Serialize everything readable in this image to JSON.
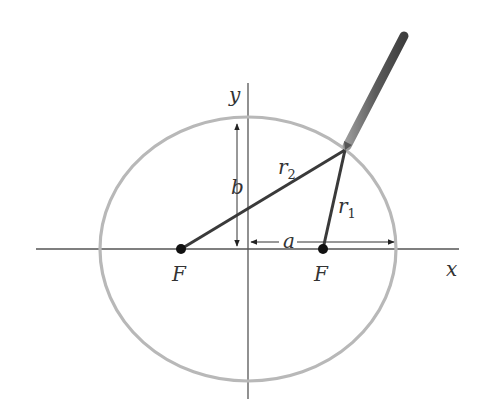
{
  "diagram": {
    "colors": {
      "ellipse": "#b8b8b8",
      "axis": "#555555",
      "string": "#3a3a3a",
      "focus": "#111111",
      "pen_light": "#8a8a8a",
      "pen_dark": "#4a4a4a",
      "text": "#333333"
    },
    "labels": {
      "y_axis": "y",
      "x_axis": "x",
      "semi_minor": "b",
      "semi_major": "a",
      "focus_left": "F",
      "focus_right": "F",
      "r1_base": "r",
      "r1_sub": "1",
      "r2_base": "r",
      "r2_sub": "2"
    },
    "geometry": {
      "center": [
        248,
        249
      ],
      "rx": 148,
      "ry": 132,
      "focus_left": [
        181,
        249
      ],
      "focus_right": [
        323,
        249
      ],
      "pen_point": [
        345,
        150
      ],
      "pen_end": [
        405,
        34
      ]
    }
  }
}
